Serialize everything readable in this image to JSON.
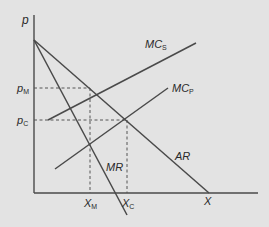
{
  "diagram": {
    "axes": {
      "y_label": "p",
      "x_label": "X"
    },
    "price_labels": {
      "pm_main": "p",
      "pm_sub": "M",
      "pc_main": "p",
      "pc_sub": "C"
    },
    "quantity_labels": {
      "xm_main": "X",
      "xm_sub": "M",
      "xc_main": "X",
      "xc_sub": "C"
    },
    "curves": {
      "mcs_main": "MC",
      "mcs_sub": "S",
      "mcp_main": "MC",
      "mcp_sub": "P",
      "ar": "AR",
      "mr": "MR"
    },
    "colors": {
      "background": "#e3e3e3",
      "line": "#4a4a4a",
      "text": "#2a2a2a"
    }
  }
}
